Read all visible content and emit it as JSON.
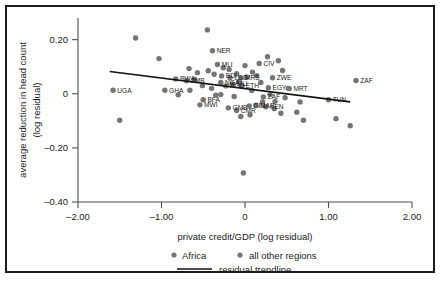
{
  "chart_data": {
    "type": "scatter",
    "title": "",
    "xlabel": "private credit/GDP (log residual)",
    "ylabel": "average reduction in head count\n(log residual)",
    "ylabel_line1": "average reduction in head count",
    "ylabel_line2": "(log residual)",
    "xlim": [
      -2.0,
      2.0
    ],
    "ylim": [
      -0.4,
      0.28
    ],
    "xticks": [
      -2.0,
      -1.0,
      0,
      1.0,
      2.0
    ],
    "xtick_labels": [
      "–2.00",
      "–1.00",
      "0",
      "1.00",
      "2.00"
    ],
    "yticks": [
      0.2,
      0,
      -0.2,
      -0.4
    ],
    "ytick_labels": [
      "0.20",
      "0",
      "–0.20",
      "–0.40"
    ],
    "grid": false,
    "legend_position": "below-axis",
    "legend": [
      {
        "marker": "dot",
        "label": "Africa"
      },
      {
        "marker": "dot",
        "label": "all other regions"
      },
      {
        "marker": "line",
        "label": "residual trendline"
      }
    ],
    "trendline": {
      "label": "residual trendline",
      "x_start": -1.62,
      "y_start": 0.082,
      "x_end": 1.26,
      "y_end": -0.03
    },
    "series": [
      {
        "name": "Africa",
        "labelled": true,
        "points": [
          {
            "label": "UGA",
            "x": -1.58,
            "y": 0.013
          },
          {
            "label": "GHA",
            "x": -0.96,
            "y": 0.013
          },
          {
            "label": "RWA",
            "x": -0.83,
            "y": 0.055
          },
          {
            "label": "ZMB",
            "x": -0.7,
            "y": 0.048
          },
          {
            "label": "NER",
            "x": -0.39,
            "y": 0.159
          },
          {
            "label": "MLI",
            "x": -0.33,
            "y": 0.108
          },
          {
            "label": "BDI",
            "x": -0.28,
            "y": 0.066
          },
          {
            "label": "LSO",
            "x": -0.18,
            "y": 0.059
          },
          {
            "label": "NGA",
            "x": -0.29,
            "y": 0.042
          },
          {
            "label": "AGO",
            "x": -0.23,
            "y": 0.029
          },
          {
            "label": "MLI",
            "x": -0.15,
            "y": 0.036
          },
          {
            "label": "MRS",
            "x": -0.05,
            "y": 0.058
          },
          {
            "label": "ETH",
            "x": -0.04,
            "y": 0.029
          },
          {
            "label": "CIV",
            "x": 0.17,
            "y": 0.112
          },
          {
            "label": "ZWE",
            "x": 0.33,
            "y": 0.059
          },
          {
            "label": "EGY",
            "x": 0.28,
            "y": 0.022
          },
          {
            "label": "MRT",
            "x": 0.53,
            "y": 0.019
          },
          {
            "label": "ZAF",
            "x": 1.33,
            "y": 0.049
          },
          {
            "label": "TUN",
            "x": 1.0,
            "y": -0.022
          },
          {
            "label": "BFA",
            "x": -0.5,
            "y": -0.022
          },
          {
            "label": "MWI",
            "x": -0.54,
            "y": -0.041
          },
          {
            "label": "GMB",
            "x": -0.2,
            "y": -0.052
          },
          {
            "label": "CMR",
            "x": -0.1,
            "y": -0.062
          },
          {
            "label": "GIN",
            "x": 0.05,
            "y": -0.045
          },
          {
            "label": "MAR",
            "x": 0.13,
            "y": -0.042
          },
          {
            "label": "KEN",
            "x": 0.25,
            "y": -0.048
          },
          {
            "label": "ZAF",
            "x": 0.22,
            "y": -0.012
          }
        ]
      },
      {
        "name": "all other regions",
        "labelled": false,
        "points": [
          {
            "x": -1.31,
            "y": 0.206
          },
          {
            "x": -1.03,
            "y": 0.13
          },
          {
            "x": -1.5,
            "y": -0.098
          },
          {
            "x": -0.67,
            "y": 0.093
          },
          {
            "x": -0.66,
            "y": 0.013
          },
          {
            "x": -0.45,
            "y": 0.236
          },
          {
            "x": -0.6,
            "y": 0.053
          },
          {
            "x": -0.57,
            "y": 0.078
          },
          {
            "x": -0.51,
            "y": 0.03
          },
          {
            "x": -0.44,
            "y": 0.085
          },
          {
            "x": -0.37,
            "y": 0.072
          },
          {
            "x": -0.35,
            "y": -0.005
          },
          {
            "x": -0.26,
            "y": 0.096
          },
          {
            "x": -0.19,
            "y": 0.09
          },
          {
            "x": -0.1,
            "y": 0.074
          },
          {
            "x": -0.07,
            "y": 0.045
          },
          {
            "x": 0.0,
            "y": 0.104
          },
          {
            "x": 0.02,
            "y": 0.062
          },
          {
            "x": 0.08,
            "y": 0.012
          },
          {
            "x": 0.09,
            "y": 0.08
          },
          {
            "x": 0.14,
            "y": 0.067
          },
          {
            "x": 0.19,
            "y": 0.042
          },
          {
            "x": 0.27,
            "y": 0.137
          },
          {
            "x": 0.4,
            "y": 0.122
          },
          {
            "x": 0.45,
            "y": 0.086
          },
          {
            "x": 0.3,
            "y": -0.003
          },
          {
            "x": 0.21,
            "y": -0.03
          },
          {
            "x": 0.36,
            "y": -0.028
          },
          {
            "x": 0.06,
            "y": -0.078
          },
          {
            "x": -0.05,
            "y": -0.084
          },
          {
            "x": 0.43,
            "y": -0.072
          },
          {
            "x": 0.62,
            "y": -0.068
          },
          {
            "x": 0.66,
            "y": -0.03
          },
          {
            "x": 0.7,
            "y": -0.098
          },
          {
            "x": 1.09,
            "y": -0.092
          },
          {
            "x": 1.26,
            "y": -0.118
          },
          {
            "x": -0.02,
            "y": -0.293
          },
          {
            "x": -0.29,
            "y": -0.003
          },
          {
            "x": -0.13,
            "y": -0.01
          },
          {
            "x": 0.52,
            "y": 0.02
          },
          {
            "x": -0.8,
            "y": -0.004
          },
          {
            "x": 0.35,
            "y": -0.055
          },
          {
            "x": -0.4,
            "y": 0.02
          },
          {
            "x": 0.48,
            "y": -0.015
          }
        ]
      }
    ]
  },
  "colors": {
    "point": "#757575",
    "trendline": "#111111",
    "frame": "#1b1b1b",
    "axis": "#4e4e4e",
    "background": "#ffffff"
  }
}
